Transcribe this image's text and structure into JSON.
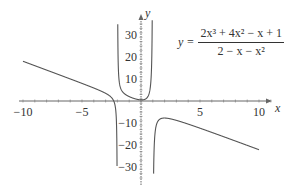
{
  "chart_data": {
    "type": "line",
    "title": "",
    "formula": {
      "lhs": "y =",
      "numerator": "2x³ + 4x² − x + 1",
      "denominator": "2 − x − x²"
    },
    "xlabel": "x",
    "ylabel": "y",
    "xlim": [
      -10,
      10
    ],
    "ylim": [
      -35,
      35
    ],
    "x_ticks": [
      -10,
      -5,
      5,
      10
    ],
    "x_tick_labels": [
      "−10",
      "−5",
      "5",
      "10"
    ],
    "y_ticks": [
      30,
      20,
      10,
      -10,
      -20,
      -30
    ],
    "y_tick_labels": [
      "30",
      "20",
      "10",
      "−10",
      "−20",
      "−30"
    ],
    "vertical_asymptotes": [
      -2,
      1
    ],
    "grid": false,
    "series": [
      {
        "name": "y = (2x^3+4x^2-x+1)/(2-x-x^2)",
        "color": "#555555"
      }
    ]
  }
}
